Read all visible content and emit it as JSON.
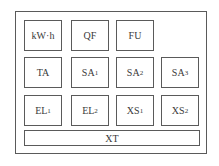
{
  "diagram": {
    "type": "panel-layout",
    "outer_label": "",
    "rows": [
      [
        {
          "id": "kwh",
          "text": "kW·h",
          "sub": ""
        },
        {
          "id": "qf",
          "text": "QF",
          "sub": ""
        },
        {
          "id": "fu",
          "text": "FU",
          "sub": ""
        }
      ],
      [
        {
          "id": "ta",
          "text": "TA",
          "sub": ""
        },
        {
          "id": "sa1",
          "text": "SA",
          "sub": "1"
        },
        {
          "id": "sa2",
          "text": "SA",
          "sub": "2"
        },
        {
          "id": "sa3",
          "text": "SA",
          "sub": "3"
        }
      ],
      [
        {
          "id": "el1",
          "text": "EL",
          "sub": "1"
        },
        {
          "id": "el2",
          "text": "EL",
          "sub": "2"
        },
        {
          "id": "xs1",
          "text": "XS",
          "sub": "1"
        },
        {
          "id": "xs2",
          "text": "XS",
          "sub": "2"
        }
      ]
    ],
    "bottom": {
      "id": "xt",
      "text": "XT",
      "sub": ""
    }
  }
}
